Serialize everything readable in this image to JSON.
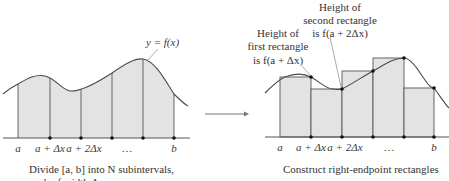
{
  "left_panel": {
    "curve_label": "y = f(x)",
    "tick_labels": [
      "a",
      "a + Δx",
      "a + 2Δx",
      "…",
      "b"
    ],
    "caption_line1": "Divide [a, b] into N subintervals,",
    "caption_line2": "each of width Δx"
  },
  "right_panel": {
    "annotation_first": [
      "Height of",
      "first rectangle",
      "is f(a + Δx)"
    ],
    "annotation_second": [
      "Height of",
      "second rectangle",
      "is f(a + 2Δx)"
    ],
    "tick_labels": [
      "a",
      "a + Δx",
      "a + 2Δx",
      "…",
      "b"
    ],
    "caption": "Construct right-endpoint rectangles"
  },
  "arrow": {
    "direction": "right"
  },
  "colors": {
    "fill": "#e3e3e3",
    "stroke": "#555555",
    "curve": "#4a4a4a",
    "dot": "#111111"
  }
}
